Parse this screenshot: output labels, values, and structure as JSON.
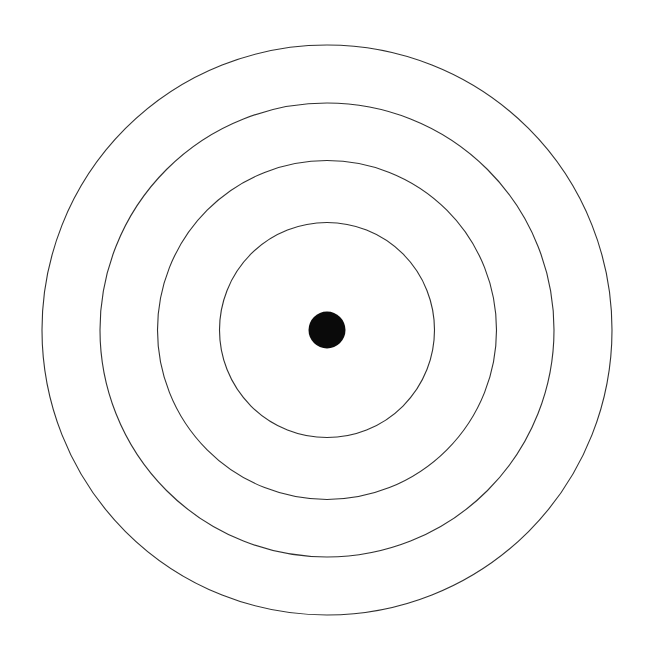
{
  "figure": {
    "background_color": "#ffffff",
    "width": 646,
    "height": 657,
    "center": {
      "x": 327,
      "y": 330
    },
    "rings": {
      "count": 4,
      "radii": [
        107.5,
        169.5,
        227,
        285
      ],
      "stroke_color": "#2f2f2f",
      "stroke_width": 1.1,
      "fill": "none"
    },
    "center_dot": {
      "radius": 18.5,
      "fill_color": "#0a0a0a"
    }
  }
}
